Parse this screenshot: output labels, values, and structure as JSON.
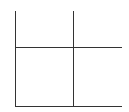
{
  "diagram": {
    "type": "quadrant-grid",
    "line_color": "#333333",
    "background": "#ffffff",
    "lines": [
      {
        "name": "left-axis",
        "orientation": "vertical",
        "x": 15,
        "y1": 11,
        "y2": 106
      },
      {
        "name": "center-divider",
        "orientation": "vertical",
        "x": 73,
        "y1": 11,
        "y2": 106
      },
      {
        "name": "middle-divider",
        "orientation": "horizontal",
        "y": 47,
        "x1": 15,
        "x2": 121
      },
      {
        "name": "bottom-axis",
        "orientation": "horizontal",
        "y": 106,
        "x1": 15,
        "x2": 121
      }
    ],
    "quadrants": [
      "top-left",
      "top-right",
      "bottom-left",
      "bottom-right"
    ]
  }
}
